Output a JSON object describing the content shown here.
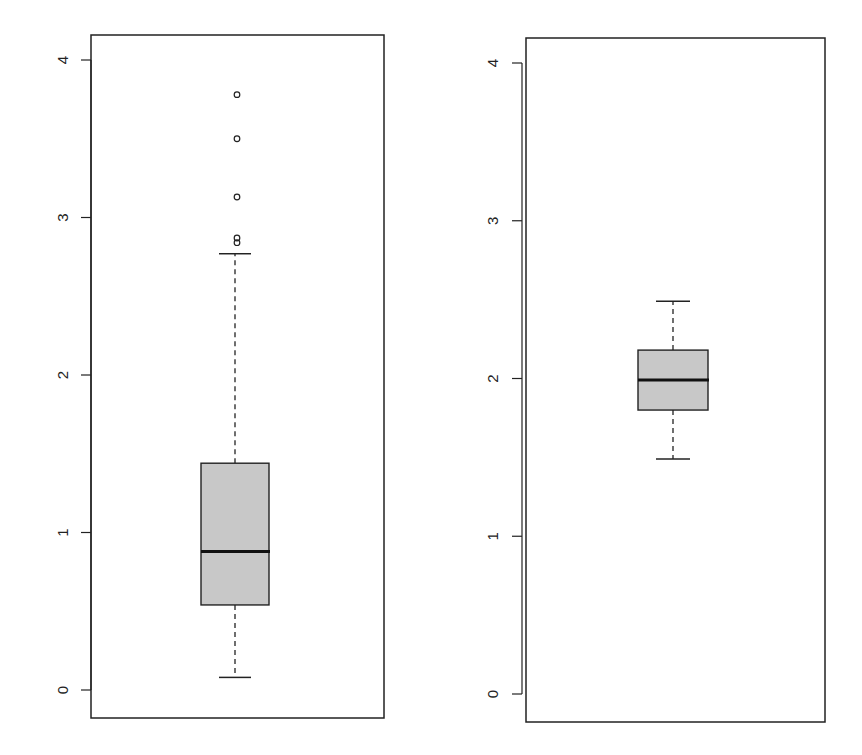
{
  "chart_data": [
    {
      "type": "box",
      "title": "",
      "xlabel": "",
      "ylabel": "",
      "ylim": [
        -0.2,
        4.15
      ],
      "yticks": [
        0,
        1,
        2,
        3,
        4
      ],
      "ytick_labels": [
        "0",
        "1",
        "2",
        "3",
        "4"
      ],
      "grid": false,
      "legend": null,
      "box": {
        "whisker_low": 0.08,
        "q1": 0.54,
        "median": 0.88,
        "q3": 1.44,
        "whisker_high": 2.77,
        "outliers": [
          2.84,
          2.87,
          3.13,
          3.5,
          3.78
        ]
      },
      "fill_color": "#c8c8c8"
    },
    {
      "type": "box",
      "title": "",
      "xlabel": "",
      "ylabel": "",
      "ylim": [
        -0.2,
        4.15
      ],
      "yticks": [
        0,
        1,
        2,
        3,
        4
      ],
      "ytick_labels": [
        "0",
        "1",
        "2",
        "3",
        "4"
      ],
      "grid": false,
      "legend": null,
      "box": {
        "whisker_low": 1.49,
        "q1": 1.8,
        "median": 1.99,
        "q3": 2.18,
        "whisker_high": 2.49,
        "outliers": []
      },
      "fill_color": "#c8c8c8"
    }
  ]
}
